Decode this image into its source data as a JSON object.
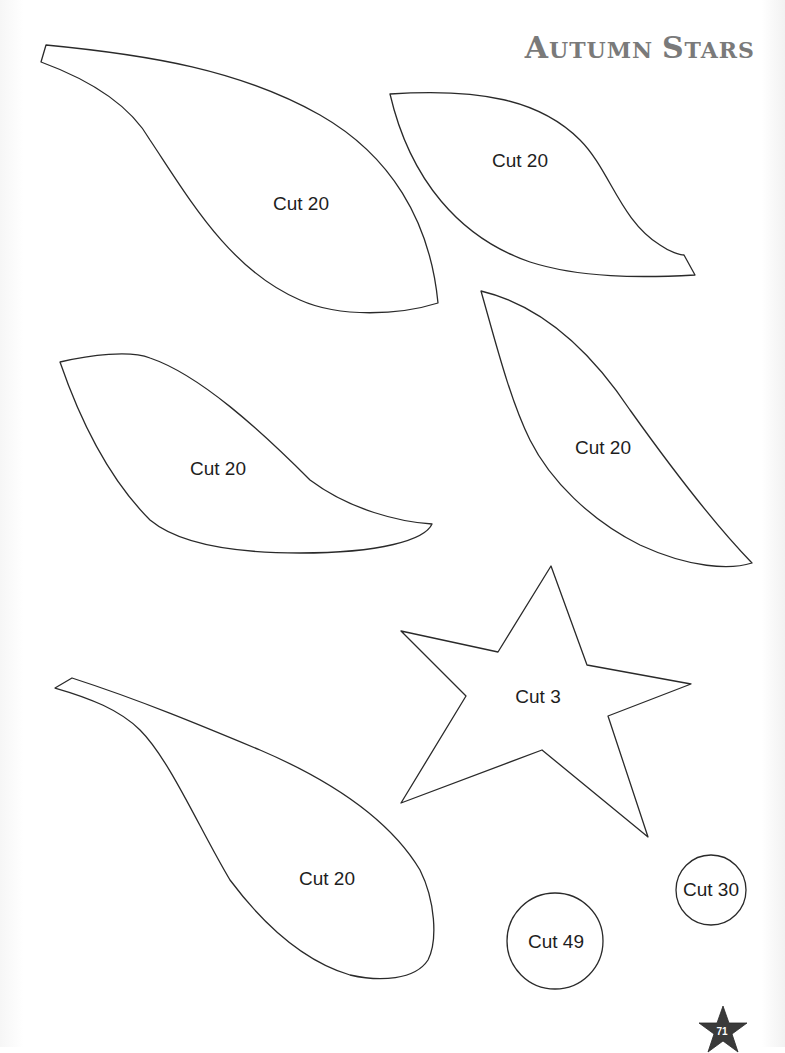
{
  "header": {
    "title_first_initial": "A",
    "title_first_rest": "UTUMN",
    "title_second_initial": "S",
    "title_second_rest": "TARS",
    "color": "#7a7a7a"
  },
  "pieces": [
    {
      "shape": "leaf-large-top-left",
      "label": "Cut 20"
    },
    {
      "shape": "leaf-top-right",
      "label": "Cut 20"
    },
    {
      "shape": "leaf-middle-left",
      "label": "Cut 20"
    },
    {
      "shape": "leaf-middle-right",
      "label": "Cut 20"
    },
    {
      "shape": "star",
      "label": "Cut 3"
    },
    {
      "shape": "leaf-bottom-left",
      "label": "Cut 20"
    },
    {
      "shape": "circle-large",
      "label": "Cut 49"
    },
    {
      "shape": "circle-small",
      "label": "Cut 30"
    }
  ],
  "footer": {
    "page_number": "71",
    "badge_icon": "star-icon",
    "badge_color": "#3a3a3a"
  }
}
